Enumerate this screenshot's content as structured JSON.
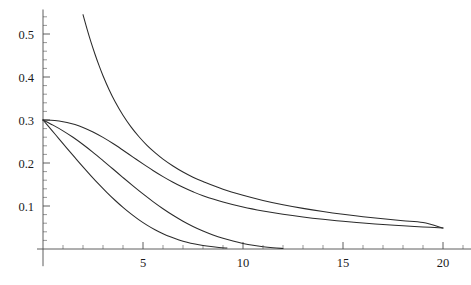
{
  "chart_data": {
    "type": "line",
    "title": "",
    "subtitle": "",
    "xlabel": "",
    "ylabel": "",
    "xlim": [
      -0.3,
      21.4
    ],
    "ylim": [
      -0.04,
      0.557
    ],
    "grid": false,
    "legend": null,
    "background_color": "#ffffff",
    "curve_color": "#2b2b2b",
    "axis_color": "#4d4d4d",
    "x_ticks_major": [
      5,
      10,
      15,
      20
    ],
    "x_tick_labels": [
      "5",
      "10",
      "15",
      "20"
    ],
    "x_ticks_minor": [
      1,
      2,
      3,
      4,
      6,
      7,
      8,
      9,
      11,
      12,
      13,
      14,
      16,
      17,
      18,
      19,
      21
    ],
    "y_ticks_major": [
      0.1,
      0.2,
      0.3,
      0.4,
      0.5
    ],
    "y_tick_labels": [
      "0.1",
      "0.2",
      "0.3",
      "0.4",
      "0.5"
    ],
    "y_ticks_minor": [
      0.02,
      0.04,
      0.06,
      0.08,
      0.12,
      0.14,
      0.16,
      0.18,
      0.22,
      0.24,
      0.26,
      0.28,
      0.32,
      0.34,
      0.36,
      0.38,
      0.42,
      0.44,
      0.46,
      0.48,
      0.52,
      0.54
    ],
    "axis_origin": {
      "x": 0,
      "y": 0
    },
    "series": [
      {
        "name": "curve-1-steep-tail",
        "description": "steeply decaying branch entering at top of frame near x=2, merging into slow power-law tail",
        "x": [
          2.0,
          2.2,
          2.4,
          2.6,
          2.8,
          3.0,
          3.3,
          3.6,
          4.0,
          4.4,
          4.8,
          5.2,
          5.6,
          6.0,
          6.5,
          7.0,
          7.5,
          8.0,
          9.0,
          10.0,
          11.0,
          12.0,
          13.0,
          14.0,
          15.0,
          16.0,
          17.0,
          18.0,
          19.0,
          20.0
        ],
        "y": [
          0.545,
          0.512,
          0.481,
          0.453,
          0.427,
          0.403,
          0.371,
          0.343,
          0.311,
          0.284,
          0.261,
          0.241,
          0.224,
          0.209,
          0.193,
          0.179,
          0.167,
          0.157,
          0.139,
          0.125,
          0.113,
          0.103,
          0.0945,
          0.0872,
          0.0808,
          0.0752,
          0.0702,
          0.0658,
          0.0618,
          0.0488
        ]
      },
      {
        "name": "curve-2-broad-shoulder",
        "description": "starts at (0,0.3), flat shoulder then sigmoid-like descent merging with curve 1 near x=7",
        "x": [
          0.0,
          0.4,
          0.8,
          1.2,
          1.6,
          2.0,
          2.5,
          3.0,
          3.5,
          4.0,
          4.5,
          5.0,
          5.5,
          6.0,
          6.5,
          7.0,
          7.5,
          8.0,
          9.0,
          10.0,
          11.0,
          12.0,
          13.0,
          14.0,
          15.0,
          16.0,
          17.0,
          18.0,
          19.0,
          20.0
        ],
        "y": [
          0.3,
          0.2995,
          0.2975,
          0.2942,
          0.2893,
          0.2828,
          0.2722,
          0.2595,
          0.2452,
          0.2297,
          0.2138,
          0.198,
          0.1827,
          0.1684,
          0.1552,
          0.1434,
          0.133,
          0.124,
          0.1092,
          0.0976,
          0.0884,
          0.0808,
          0.0744,
          0.069,
          0.0644,
          0.0604,
          0.057,
          0.054,
          0.0513,
          0.0489
        ]
      },
      {
        "name": "curve-3-middle",
        "description": "starts at (0,0.3), moderate decay reaching zero near x=11",
        "x": [
          0.0,
          0.5,
          1.0,
          1.5,
          2.0,
          2.5,
          3.0,
          3.5,
          4.0,
          4.5,
          5.0,
          5.5,
          6.0,
          6.5,
          7.0,
          7.5,
          8.0,
          8.5,
          9.0,
          9.5,
          10.0,
          10.5,
          11.0,
          11.5,
          12.0
        ],
        "y": [
          0.3,
          0.288,
          0.2748,
          0.2598,
          0.243,
          0.2248,
          0.2056,
          0.186,
          0.1662,
          0.1468,
          0.128,
          0.1102,
          0.0936,
          0.0784,
          0.0646,
          0.0524,
          0.0418,
          0.0326,
          0.0248,
          0.0184,
          0.013,
          0.0086,
          0.0052,
          0.0028,
          0.0012
        ]
      },
      {
        "name": "curve-4-fast",
        "description": "starts at (0,0.3), fastest decay reaching zero near x=8.5",
        "x": [
          0.0,
          0.4,
          0.8,
          1.2,
          1.6,
          2.0,
          2.4,
          2.8,
          3.2,
          3.6,
          4.0,
          4.4,
          4.8,
          5.2,
          5.6,
          6.0,
          6.4,
          6.8,
          7.2,
          7.6,
          8.0,
          8.4,
          8.8,
          9.2
        ],
        "y": [
          0.3,
          0.2782,
          0.2562,
          0.2342,
          0.2124,
          0.191,
          0.1702,
          0.1502,
          0.1312,
          0.1134,
          0.0968,
          0.0816,
          0.0678,
          0.0556,
          0.0448,
          0.0356,
          0.0278,
          0.0212,
          0.0158,
          0.0116,
          0.0082,
          0.0056,
          0.0036,
          0.0022
        ]
      }
    ]
  }
}
